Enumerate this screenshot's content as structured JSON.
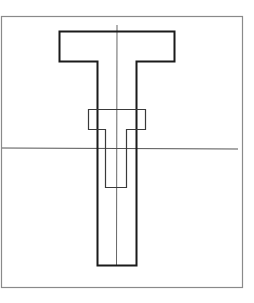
{
  "diagram": {
    "type": "cross-section outline",
    "colors": {
      "background": "#ffffff",
      "frame": "#8a8a8a",
      "outer_shape": "#1a1a1a",
      "inner_shape": "#3a3a3a",
      "reference_lines": "#555555"
    },
    "labels": []
  }
}
